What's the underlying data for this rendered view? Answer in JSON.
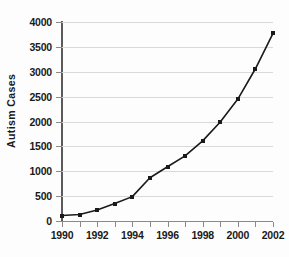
{
  "chart_data": {
    "type": "line",
    "title": "",
    "xlabel": "",
    "ylabel": "Autism Cases",
    "xlim": [
      1990,
      2002
    ],
    "ylim": [
      0,
      4000
    ],
    "grid": true,
    "legend": false,
    "marker": "square",
    "line_color": "#1a1a1a",
    "grid_color": "#d9d9d9",
    "x": [
      1990,
      1991,
      1992,
      1993,
      1994,
      1995,
      1996,
      1997,
      1998,
      1999,
      2000,
      2001,
      2002
    ],
    "values": [
      110,
      130,
      220,
      350,
      490,
      870,
      1090,
      1310,
      1610,
      1990,
      2450,
      3060,
      3770
    ],
    "xticks": [
      1990,
      1991,
      1992,
      1993,
      1994,
      1995,
      1996,
      1997,
      1998,
      1999,
      2000,
      2001,
      2002
    ],
    "xtick_labels": [
      "1990",
      "",
      "1992",
      "",
      "1994",
      "",
      "1996",
      "",
      "1998",
      "",
      "2000",
      "",
      "2002"
    ],
    "xtick_labels_shown": [
      "1990",
      "1992",
      "1994",
      "1996",
      "1998",
      "2000",
      "2002"
    ],
    "yticks": [
      0,
      500,
      1000,
      1500,
      2000,
      2500,
      3000,
      3500,
      4000
    ],
    "ytick_labels": [
      "0",
      "500",
      "1000",
      "1500",
      "2000",
      "2500",
      "3000",
      "3500",
      "4000"
    ]
  }
}
